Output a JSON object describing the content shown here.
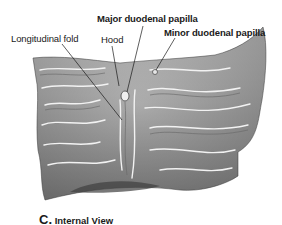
{
  "figure": {
    "labels": {
      "major_papilla": "Major duodenal papilla",
      "longitudinal_fold": "Longitudinal fold",
      "hood": "Hood",
      "minor_papilla": "Minor duodenal papilla"
    },
    "caption": {
      "letter": "C.",
      "text": "Internal View"
    },
    "colors": {
      "tissue_light": "#d8d8d8",
      "tissue_mid": "#9a9a9a",
      "tissue_dark": "#4a4a4a",
      "leader_line": "#1a1a1a"
    }
  }
}
